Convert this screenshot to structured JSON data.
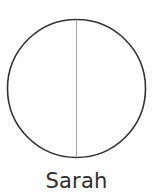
{
  "diagram": {
    "type": "circle-divided-vertically",
    "circle": {
      "cx": 76.5,
      "cy": 88.5,
      "r": 69,
      "stroke_color": "#333333",
      "stroke_width": 1.6
    },
    "divider": {
      "orientation": "vertical",
      "stroke_color": "#9a9a9a",
      "stroke_width": 0.9
    },
    "label": "Sarah"
  }
}
